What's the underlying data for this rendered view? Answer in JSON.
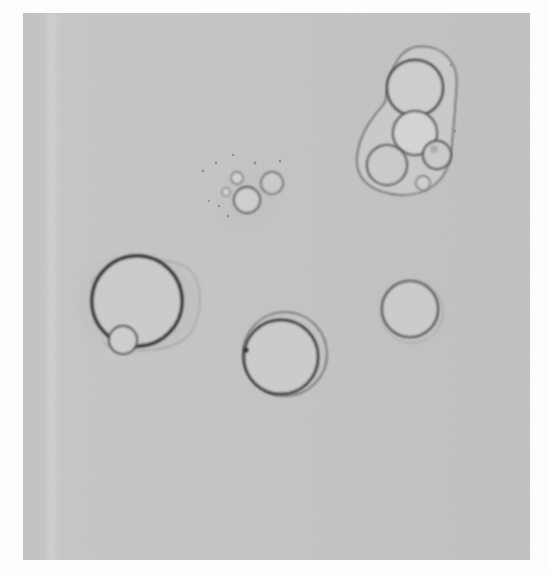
{
  "image": {
    "type": "light micrograph",
    "description": "Grayscale microscope photograph of spherical vesicles/droplets on a uniform gray background",
    "colors": {
      "page_background": "#fdfdfd",
      "field_background": "#c4c4c4",
      "field_light_band": "#d2d2d2",
      "outline_dark": "#3a3a3a",
      "outline_mid": "#5c5c5c",
      "interior": "#cbcbcb",
      "halo": "#b4b4b4"
    },
    "objects": [
      {
        "name": "multi-vesicle-cluster",
        "position": "top-right",
        "envelope": true,
        "inner_count": 5
      },
      {
        "name": "small-bubble-cluster",
        "position": "upper-center",
        "inner_count": 4
      },
      {
        "name": "large-vesicle",
        "position": "middle-left",
        "has_satellite": true
      },
      {
        "name": "double-ring-vesicle",
        "position": "lower-center"
      },
      {
        "name": "single-vesicle",
        "position": "middle-right"
      }
    ]
  }
}
